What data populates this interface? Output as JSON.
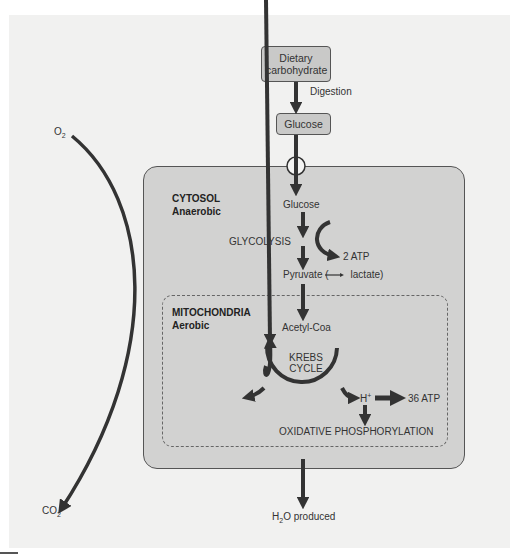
{
  "diagram": {
    "type": "metabolic-pathway",
    "nodes": {
      "dietary_carbohydrate": "Dietary carbohydrate",
      "digestion": "Digestion",
      "glucose_outside": "Glucose",
      "glucose_inside": "Glucose",
      "glycolysis": "GLYCOLYSIS",
      "atp_glycolysis": "2 ATP",
      "pyruvate_prefix": "Pyruvate (",
      "pyruvate_suffix": "lactate)",
      "acetyl_coa": "Acetyl-Coa",
      "krebs_line1": "KREBS",
      "krebs_line2": "CYCLE",
      "h_plus": "H",
      "h_plus_sup": "+",
      "atp_oxidative": "36 ATP",
      "oxidative_phosphorylation": "OXIDATIVE PHOSPHORYLATION",
      "water_prefix": "H",
      "water_sub": "2",
      "water_suffix": "O produced"
    },
    "regions": {
      "cytosol_title": "CYTOSOL",
      "cytosol_sub": "Anaerobic",
      "mito_title": "MITOCHONDRIA",
      "mito_sub": "Aerobic"
    },
    "gases": {
      "o2": "O",
      "o2_sub": "2",
      "co2": "CO",
      "co2_sub": "2"
    },
    "colors": {
      "background": "#f1f1f0",
      "cell_fill": "#d2d2d1",
      "box_fill": "#c9c9c8",
      "arrow": "#333333"
    }
  }
}
